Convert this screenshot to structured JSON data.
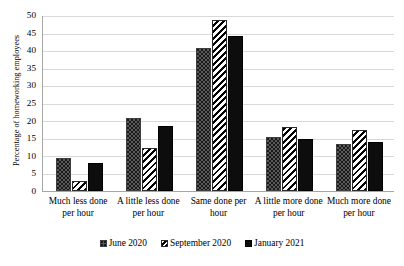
{
  "chart_data": {
    "type": "bar",
    "title": "",
    "xlabel": "",
    "ylabel": "Percentage of homeworking employees",
    "ylim": [
      0,
      50
    ],
    "ytick_step": 5,
    "yticks": [
      50,
      45,
      40,
      35,
      30,
      25,
      20,
      15,
      10,
      5,
      0
    ],
    "grid": true,
    "legend_position": "bottom",
    "categories": [
      "Much less done per hour",
      "A little less done per hour",
      "Same done per hour",
      "A little more done per hour",
      "Much more done per hour"
    ],
    "series": [
      {
        "name": "June 2020",
        "pattern": "dotted",
        "color": "#595959",
        "values": [
          9.3,
          21.0,
          40.8,
          15.3,
          13.5
        ]
      },
      {
        "name": "September 2020",
        "pattern": "diagonal-stripes",
        "color": "#ffffff",
        "values": [
          3.0,
          12.2,
          48.8,
          18.3,
          17.4
        ]
      },
      {
        "name": "January 2021",
        "pattern": "solid",
        "color": "#0d0d0d",
        "values": [
          8.1,
          18.5,
          44.3,
          14.8,
          14.0
        ]
      }
    ]
  },
  "axis": {
    "y_title": "Percentage of homeworking employees",
    "tick_0": "0",
    "tick_1": "5",
    "tick_2": "10",
    "tick_3": "15",
    "tick_4": "20",
    "tick_5": "25",
    "tick_6": "30",
    "tick_7": "35",
    "tick_8": "40",
    "tick_9": "45",
    "tick_10": "50"
  },
  "categories": {
    "c0": "Much less done per hour",
    "c1": "A little less done per hour",
    "c2": "Same done per hour",
    "c3": "A little more done per hour",
    "c4": "Much more done per hour"
  },
  "legend": {
    "item_0": "June 2020",
    "item_1": "September 2020",
    "item_2": "January 2021"
  },
  "colors": {
    "gridline": "#d9d9d9",
    "axis": "#a6a6a6",
    "series_june": "#595959",
    "series_september": "#ffffff",
    "series_january": "#0d0d0d"
  }
}
